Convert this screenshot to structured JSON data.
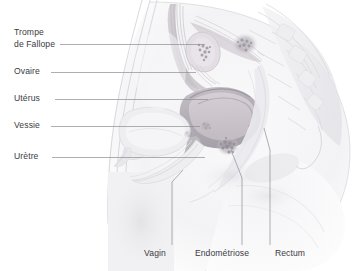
{
  "figure": {
    "language": "fr",
    "illustration": "female-pelvis-sagittal-section",
    "background_color": "#ffffff",
    "label_text_color": "#3b3b3f",
    "leader_line_color": "#8d8d93",
    "tissue_colors": {
      "skin_outline": "#d9d9dc",
      "soft_tissue": "#ededf0",
      "uterus_body": "#b9b3ba",
      "uterus_cavity": "#cfc8cd",
      "bladder": "#e3e3e7",
      "rectum": "#e0e0e4",
      "bone_sacrum": "#e6e6ea",
      "endometriosis_lesion": "#a9a4ad",
      "fallopian_tube": "#c9c4cb",
      "ovary": "#ddd8dd"
    }
  },
  "labels": {
    "left": [
      {
        "id": "trompe-de-fallope",
        "line1": "Trompe",
        "line2": "de Fallope"
      },
      {
        "id": "ovaire",
        "line1": "Ovaire",
        "line2": ""
      },
      {
        "id": "uterus",
        "line1": "Utérus",
        "line2": ""
      },
      {
        "id": "vessie",
        "line1": "Vessie",
        "line2": ""
      },
      {
        "id": "uretre",
        "line1": "Urètre",
        "line2": ""
      }
    ],
    "bottom": [
      {
        "id": "vagin",
        "text": "Vagin"
      },
      {
        "id": "endometriose",
        "text": "Endométriose"
      },
      {
        "id": "rectum",
        "text": "Rectum"
      }
    ]
  }
}
